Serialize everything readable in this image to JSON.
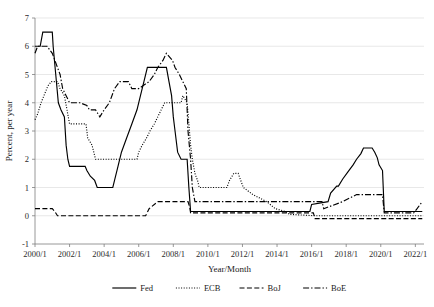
{
  "chart_data": {
    "type": "line",
    "title": "",
    "xlabel": "Year/Month",
    "ylabel": "Percent, per year",
    "xlim": [
      2000.0,
      2022.5
    ],
    "ylim": [
      -1,
      7
    ],
    "yticks": [
      -1,
      0,
      1,
      2,
      3,
      4,
      5,
      6,
      7
    ],
    "ytick_labels": [
      "-1",
      "0",
      "1",
      "2",
      "3",
      "4",
      "5",
      "6",
      "7"
    ],
    "xticks": [
      2000,
      2002,
      2004,
      2006,
      2008,
      2010,
      2012,
      2014,
      2016,
      2018,
      2020,
      2022
    ],
    "xtick_labels": [
      "2000/1",
      "2002/1",
      "2004/1",
      "2006/1",
      "2008/1",
      "2010/1",
      "2012/1",
      "2014/1",
      "2016/1",
      "2018/1",
      "2020/1",
      "2022/1"
    ],
    "grid": "horizontal",
    "legend_position": "bottom",
    "series": [
      {
        "name": "Fed",
        "dash_style": "solid",
        "color": "#000000",
        "points": [
          [
            2000.0,
            6.0
          ],
          [
            2000.3,
            6.0
          ],
          [
            2000.45,
            6.5
          ],
          [
            2001.0,
            6.5
          ],
          [
            2001.05,
            6.0
          ],
          [
            2001.2,
            5.0
          ],
          [
            2001.35,
            4.0
          ],
          [
            2001.5,
            3.75
          ],
          [
            2001.7,
            3.5
          ],
          [
            2001.8,
            2.5
          ],
          [
            2001.9,
            2.0
          ],
          [
            2002.0,
            1.75
          ],
          [
            2002.9,
            1.75
          ],
          [
            2003.0,
            1.6
          ],
          [
            2003.2,
            1.4
          ],
          [
            2003.45,
            1.25
          ],
          [
            2003.6,
            1.0
          ],
          [
            2004.5,
            1.0
          ],
          [
            2004.6,
            1.25
          ],
          [
            2004.8,
            1.75
          ],
          [
            2005.0,
            2.25
          ],
          [
            2005.3,
            2.75
          ],
          [
            2005.6,
            3.25
          ],
          [
            2005.9,
            3.75
          ],
          [
            2006.1,
            4.25
          ],
          [
            2006.3,
            4.75
          ],
          [
            2006.5,
            5.25
          ],
          [
            2007.6,
            5.25
          ],
          [
            2007.75,
            4.75
          ],
          [
            2007.9,
            4.25
          ],
          [
            2008.0,
            3.5
          ],
          [
            2008.1,
            3.0
          ],
          [
            2008.25,
            2.25
          ],
          [
            2008.45,
            2.0
          ],
          [
            2008.8,
            2.0
          ],
          [
            2008.9,
            1.0
          ],
          [
            2009.0,
            0.15
          ],
          [
            2015.9,
            0.15
          ],
          [
            2016.0,
            0.4
          ],
          [
            2016.95,
            0.5
          ],
          [
            2017.1,
            0.8
          ],
          [
            2017.45,
            1.05
          ],
          [
            2017.55,
            1.05
          ],
          [
            2017.8,
            1.3
          ],
          [
            2018.1,
            1.55
          ],
          [
            2018.4,
            1.8
          ],
          [
            2018.6,
            2.0
          ],
          [
            2018.85,
            2.2
          ],
          [
            2019.0,
            2.4
          ],
          [
            2019.5,
            2.4
          ],
          [
            2019.65,
            2.25
          ],
          [
            2019.8,
            2.05
          ],
          [
            2019.9,
            1.8
          ],
          [
            2020.1,
            1.6
          ],
          [
            2020.2,
            0.15
          ],
          [
            2022.4,
            0.15
          ]
        ]
      },
      {
        "name": "ECB",
        "dash_style": "dotted",
        "color": "#000000",
        "points": [
          [
            2000.0,
            3.4
          ],
          [
            2000.15,
            3.6
          ],
          [
            2000.35,
            4.0
          ],
          [
            2000.55,
            4.3
          ],
          [
            2000.75,
            4.6
          ],
          [
            2000.95,
            4.75
          ],
          [
            2001.3,
            4.75
          ],
          [
            2001.45,
            4.5
          ],
          [
            2001.7,
            4.25
          ],
          [
            2001.85,
            3.75
          ],
          [
            2002.0,
            3.25
          ],
          [
            2002.5,
            3.25
          ],
          [
            2002.95,
            3.25
          ],
          [
            2003.05,
            2.75
          ],
          [
            2003.3,
            2.5
          ],
          [
            2003.5,
            2.0
          ],
          [
            2005.9,
            2.0
          ],
          [
            2006.0,
            2.25
          ],
          [
            2006.2,
            2.5
          ],
          [
            2006.45,
            2.75
          ],
          [
            2006.65,
            3.0
          ],
          [
            2006.9,
            3.25
          ],
          [
            2007.1,
            3.5
          ],
          [
            2007.3,
            3.75
          ],
          [
            2007.5,
            4.0
          ],
          [
            2008.45,
            4.0
          ],
          [
            2008.55,
            4.25
          ],
          [
            2008.8,
            4.0
          ],
          [
            2008.9,
            3.25
          ],
          [
            2009.0,
            2.5
          ],
          [
            2009.1,
            2.0
          ],
          [
            2009.25,
            1.5
          ],
          [
            2009.4,
            1.25
          ],
          [
            2009.5,
            1.0
          ],
          [
            2011.1,
            1.0
          ],
          [
            2011.25,
            1.25
          ],
          [
            2011.5,
            1.5
          ],
          [
            2011.75,
            1.5
          ],
          [
            2011.9,
            1.25
          ],
          [
            2012.05,
            1.0
          ],
          [
            2012.6,
            0.75
          ],
          [
            2013.4,
            0.5
          ],
          [
            2013.9,
            0.25
          ],
          [
            2014.5,
            0.15
          ],
          [
            2014.7,
            0.05
          ],
          [
            2016.2,
            0.0
          ],
          [
            2022.4,
            0.0
          ]
        ]
      },
      {
        "name": "BoJ",
        "dash_style": "dashed",
        "color": "#000000",
        "points": [
          [
            2000.0,
            0.25
          ],
          [
            2000.7,
            0.25
          ],
          [
            2001.0,
            0.25
          ],
          [
            2001.15,
            0.15
          ],
          [
            2001.3,
            0.0
          ],
          [
            2006.4,
            0.0
          ],
          [
            2006.6,
            0.25
          ],
          [
            2007.1,
            0.5
          ],
          [
            2008.85,
            0.5
          ],
          [
            2008.95,
            0.3
          ],
          [
            2009.0,
            0.1
          ],
          [
            2016.1,
            0.1
          ],
          [
            2016.2,
            -0.1
          ],
          [
            2022.4,
            -0.1
          ]
        ]
      },
      {
        "name": "BoE",
        "dash_style": "dashdot",
        "color": "#000000",
        "points": [
          [
            2000.0,
            5.75
          ],
          [
            2000.15,
            6.0
          ],
          [
            2000.7,
            6.0
          ],
          [
            2001.0,
            5.75
          ],
          [
            2001.15,
            5.5
          ],
          [
            2001.3,
            5.25
          ],
          [
            2001.45,
            5.0
          ],
          [
            2001.6,
            4.5
          ],
          [
            2001.8,
            4.25
          ],
          [
            2002.0,
            4.0
          ],
          [
            2002.6,
            4.0
          ],
          [
            2003.0,
            3.9
          ],
          [
            2003.15,
            3.75
          ],
          [
            2003.5,
            3.75
          ],
          [
            2003.75,
            3.5
          ],
          [
            2004.0,
            3.75
          ],
          [
            2004.3,
            4.0
          ],
          [
            2004.6,
            4.5
          ],
          [
            2004.9,
            4.75
          ],
          [
            2005.4,
            4.75
          ],
          [
            2005.6,
            4.5
          ],
          [
            2006.0,
            4.5
          ],
          [
            2006.6,
            4.75
          ],
          [
            2006.9,
            5.0
          ],
          [
            2007.1,
            5.25
          ],
          [
            2007.4,
            5.5
          ],
          [
            2007.6,
            5.75
          ],
          [
            2007.95,
            5.5
          ],
          [
            2008.1,
            5.25
          ],
          [
            2008.35,
            5.0
          ],
          [
            2008.75,
            4.5
          ],
          [
            2008.85,
            3.0
          ],
          [
            2009.0,
            2.0
          ],
          [
            2009.1,
            1.0
          ],
          [
            2009.25,
            0.5
          ],
          [
            2016.6,
            0.5
          ],
          [
            2016.7,
            0.25
          ],
          [
            2017.8,
            0.5
          ],
          [
            2018.6,
            0.75
          ],
          [
            2020.1,
            0.75
          ],
          [
            2020.2,
            0.1
          ],
          [
            2021.9,
            0.1
          ],
          [
            2022.1,
            0.25
          ],
          [
            2022.4,
            0.5
          ]
        ]
      }
    ]
  },
  "legend": {
    "items": [
      {
        "label": "Fed",
        "dash_style": "solid"
      },
      {
        "label": "ECB",
        "dash_style": "dotted"
      },
      {
        "label": "BoJ",
        "dash_style": "dashed"
      },
      {
        "label": "BoE",
        "dash_style": "dashdot"
      }
    ]
  }
}
